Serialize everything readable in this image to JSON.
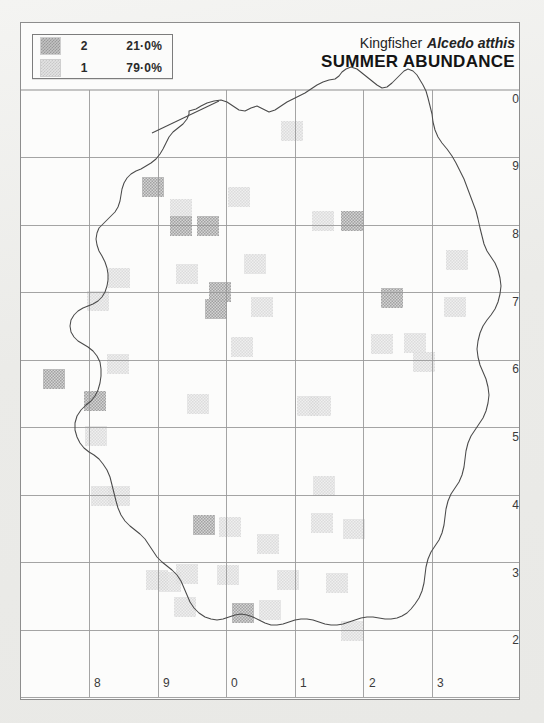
{
  "title": {
    "common_name": "Kingfisher",
    "scientific_name": "Alcedo atthis",
    "subtitle": "SUMMER ABUNDANCE"
  },
  "legend": {
    "rows": [
      {
        "value": "2",
        "percent": "21·0%",
        "swatch": "dark-hatch-swatch"
      },
      {
        "value": "1",
        "percent": "79·0%",
        "swatch": "light-hatch-swatch"
      }
    ]
  },
  "chart_data": {
    "type": "heatmap",
    "xlabel": "",
    "ylabel": "",
    "grid": true,
    "legend_position": "top-left",
    "colors": {
      "value_1": "#e2e2e2",
      "value_2": "#bdbdbd",
      "grid": "#8d8d8d",
      "coastline": "#4a4a4a"
    },
    "x_ticks": [
      "8",
      "9",
      "0",
      "1",
      "2",
      "3"
    ],
    "y_ticks": [
      "0",
      "9",
      "8",
      "7",
      "6",
      "5",
      "4",
      "3",
      "2"
    ],
    "x_range": [
      7,
      14
    ],
    "y_range": [
      2,
      10
    ],
    "cell_size_px": 68.5,
    "categories": [
      "1",
      "2"
    ],
    "values": [
      21.0,
      79.0
    ],
    "series": [
      {
        "name": "2",
        "percent": 21.0
      },
      {
        "name": "1",
        "percent": 79.0
      }
    ],
    "cells": [
      {
        "cx": 151,
        "cy": 185,
        "v": 2
      },
      {
        "cx": 237,
        "cy": 195,
        "v": 1
      },
      {
        "cx": 290,
        "cy": 129,
        "v": 1
      },
      {
        "cx": 179,
        "cy": 207,
        "v": 1
      },
      {
        "cx": 179,
        "cy": 224,
        "v": 2
      },
      {
        "cx": 206,
        "cy": 224,
        "v": 2
      },
      {
        "cx": 321,
        "cy": 219,
        "v": 1
      },
      {
        "cx": 350,
        "cy": 219,
        "v": 2
      },
      {
        "cx": 117,
        "cy": 276,
        "v": 1
      },
      {
        "cx": 185,
        "cy": 272,
        "v": 1
      },
      {
        "cx": 253,
        "cy": 262,
        "v": 1
      },
      {
        "cx": 455,
        "cy": 258,
        "v": 1
      },
      {
        "cx": 218,
        "cy": 290,
        "v": 2
      },
      {
        "cx": 214,
        "cy": 307,
        "v": 2
      },
      {
        "cx": 96,
        "cy": 299,
        "v": 1
      },
      {
        "cx": 260,
        "cy": 305,
        "v": 1
      },
      {
        "cx": 390,
        "cy": 296,
        "v": 2
      },
      {
        "cx": 453,
        "cy": 305,
        "v": 1
      },
      {
        "cx": 240,
        "cy": 345,
        "v": 1
      },
      {
        "cx": 380,
        "cy": 342,
        "v": 1
      },
      {
        "cx": 413,
        "cy": 341,
        "v": 1
      },
      {
        "cx": 52,
        "cy": 377,
        "v": 2
      },
      {
        "cx": 116,
        "cy": 362,
        "v": 1
      },
      {
        "cx": 196,
        "cy": 402,
        "v": 1
      },
      {
        "cx": 318,
        "cy": 404,
        "v": 1
      },
      {
        "cx": 93,
        "cy": 399,
        "v": 2
      },
      {
        "cx": 322,
        "cy": 484,
        "v": 1
      },
      {
        "cx": 100,
        "cy": 494,
        "v": 1
      },
      {
        "cx": 117,
        "cy": 494,
        "v": 1
      },
      {
        "cx": 202,
        "cy": 523,
        "v": 2
      },
      {
        "cx": 228,
        "cy": 525,
        "v": 1
      },
      {
        "cx": 320,
        "cy": 521,
        "v": 1
      },
      {
        "cx": 352,
        "cy": 527,
        "v": 1
      },
      {
        "cx": 266,
        "cy": 542,
        "v": 1
      },
      {
        "cx": 185,
        "cy": 572,
        "v": 1
      },
      {
        "cx": 155,
        "cy": 578,
        "v": 1
      },
      {
        "cx": 168,
        "cy": 580,
        "v": 1
      },
      {
        "cx": 226,
        "cy": 573,
        "v": 1
      },
      {
        "cx": 286,
        "cy": 578,
        "v": 1
      },
      {
        "cx": 335,
        "cy": 581,
        "v": 1
      },
      {
        "cx": 183,
        "cy": 605,
        "v": 1
      },
      {
        "cx": 241,
        "cy": 611,
        "v": 2
      },
      {
        "cx": 268,
        "cy": 608,
        "v": 1
      },
      {
        "cx": 350,
        "cy": 629,
        "v": 1
      },
      {
        "cx": 94,
        "cy": 434,
        "v": 1
      },
      {
        "cx": 422,
        "cy": 360,
        "v": 1
      },
      {
        "cx": 306,
        "cy": 404,
        "v": 1
      }
    ]
  },
  "axes": {
    "right_labels": [
      "0",
      "9",
      "8",
      "7",
      "6",
      "5",
      "4",
      "3",
      "2"
    ],
    "bottom_labels": [
      "8",
      "9",
      "0",
      "1",
      "2",
      "3"
    ]
  }
}
